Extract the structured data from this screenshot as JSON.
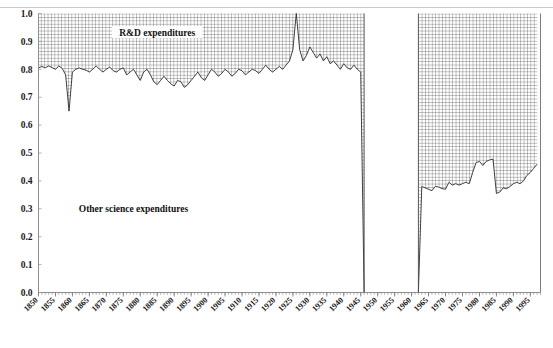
{
  "chart_data": {
    "type": "area",
    "title": "",
    "subtitle": "",
    "xlabel": "",
    "ylabel": "",
    "grid": true,
    "legend_position": "inside-annotations",
    "xlim": [
      1850,
      1998
    ],
    "ylim": [
      0.0,
      1.0
    ],
    "y_ticks": [
      "0.0",
      "0.1",
      "0.2",
      "0.3",
      "0.4",
      "0.5",
      "0.6",
      "0.7",
      "0.8",
      "0.9",
      "1.0"
    ],
    "y_tick_values": [
      0.0,
      0.1,
      0.2,
      0.3,
      0.4,
      0.5,
      0.6,
      0.7,
      0.8,
      0.9,
      1.0
    ],
    "x_ticks": [
      "1850",
      "1855",
      "1860",
      "1865",
      "1870",
      "1875",
      "1880",
      "1885",
      "1890",
      "1895",
      "1900",
      "1905",
      "1910",
      "1915",
      "1920",
      "1925",
      "1930",
      "1935",
      "1940",
      "1945",
      "1950",
      "1955",
      "1960",
      "1965",
      "1970",
      "1975",
      "1980",
      "1985",
      "1990",
      "1995"
    ],
    "x_tick_values": [
      1850,
      1855,
      1860,
      1865,
      1870,
      1875,
      1880,
      1885,
      1890,
      1895,
      1900,
      1905,
      1910,
      1915,
      1920,
      1925,
      1930,
      1935,
      1940,
      1945,
      1950,
      1955,
      1960,
      1965,
      1970,
      1975,
      1980,
      1985,
      1990,
      1995
    ],
    "annotations": [
      {
        "text": "R&D expenditures",
        "x": 1885,
        "y": 0.93
      },
      {
        "text": "Other science expenditures",
        "x": 1878,
        "y": 0.3
      }
    ],
    "series": [
      {
        "name": "R&D expenditures",
        "fill": "crosshatch",
        "description": "Upper region between the line and 1.0 is crosshatched; area below the line up to 0 is the white 'Other science expenditures' region.",
        "x": [
          1850,
          1851,
          1852,
          1853,
          1854,
          1855,
          1856,
          1857,
          1858,
          1859,
          1860,
          1861,
          1862,
          1863,
          1864,
          1865,
          1866,
          1867,
          1868,
          1869,
          1870,
          1871,
          1872,
          1873,
          1874,
          1875,
          1876,
          1877,
          1878,
          1879,
          1880,
          1881,
          1882,
          1883,
          1884,
          1885,
          1886,
          1887,
          1888,
          1889,
          1890,
          1891,
          1892,
          1893,
          1894,
          1895,
          1896,
          1897,
          1898,
          1899,
          1900,
          1901,
          1902,
          1903,
          1904,
          1905,
          1906,
          1907,
          1908,
          1909,
          1910,
          1911,
          1912,
          1913,
          1914,
          1915,
          1916,
          1917,
          1918,
          1919,
          1920,
          1921,
          1922,
          1923,
          1924,
          1925,
          1926,
          1927,
          1928,
          1929,
          1930,
          1931,
          1932,
          1933,
          1934,
          1935,
          1936,
          1937,
          1938,
          1939,
          1940,
          1941,
          1942,
          1943,
          1944,
          1945,
          1946,
          1962,
          1963,
          1964,
          1965,
          1966,
          1967,
          1968,
          1969,
          1970,
          1971,
          1972,
          1973,
          1974,
          1975,
          1976,
          1977,
          1978,
          1979,
          1980,
          1981,
          1982,
          1983,
          1984,
          1985,
          1986,
          1987,
          1988,
          1989,
          1990,
          1991,
          1992,
          1993,
          1994,
          1995,
          1996,
          1997
        ],
        "values": [
          0.805,
          0.81,
          0.805,
          0.812,
          0.806,
          0.8,
          0.812,
          0.803,
          0.78,
          0.65,
          0.79,
          0.8,
          0.805,
          0.8,
          0.797,
          0.79,
          0.8,
          0.812,
          0.8,
          0.79,
          0.8,
          0.808,
          0.795,
          0.79,
          0.8,
          0.805,
          0.78,
          0.79,
          0.8,
          0.78,
          0.76,
          0.79,
          0.8,
          0.78,
          0.755,
          0.745,
          0.76,
          0.775,
          0.76,
          0.748,
          0.74,
          0.76,
          0.755,
          0.735,
          0.745,
          0.76,
          0.775,
          0.79,
          0.77,
          0.76,
          0.78,
          0.8,
          0.79,
          0.775,
          0.785,
          0.8,
          0.79,
          0.775,
          0.785,
          0.8,
          0.795,
          0.78,
          0.79,
          0.8,
          0.795,
          0.785,
          0.8,
          0.815,
          0.8,
          0.79,
          0.8,
          0.81,
          0.8,
          0.815,
          0.83,
          0.87,
          1.0,
          0.87,
          0.83,
          0.85,
          0.88,
          0.86,
          0.84,
          0.855,
          0.83,
          0.845,
          0.82,
          0.83,
          0.815,
          0.8,
          0.82,
          0.805,
          0.8,
          0.815,
          0.8,
          0.79,
          0.0,
          0.0,
          0.38,
          0.375,
          0.37,
          0.365,
          0.38,
          0.378,
          0.372,
          0.37,
          0.395,
          0.385,
          0.39,
          0.385,
          0.39,
          0.395,
          0.39,
          0.43,
          0.465,
          0.47,
          0.455,
          0.47,
          0.475,
          0.478,
          0.355,
          0.36,
          0.375,
          0.372,
          0.38,
          0.39,
          0.395,
          0.39,
          0.4,
          0.42,
          0.43,
          0.445,
          0.46
        ],
        "gap_start": 1946,
        "gap_end": 1962
      }
    ]
  }
}
